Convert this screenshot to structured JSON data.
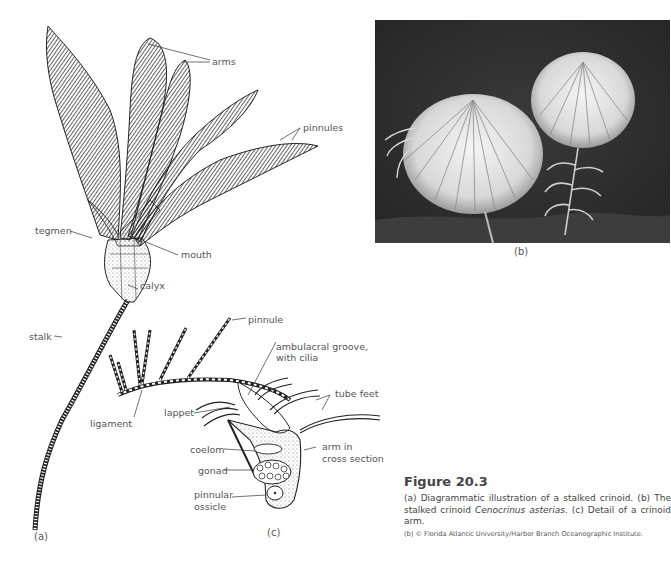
{
  "panel_a": {
    "label": "(a)",
    "callouts": {
      "arms": "arms",
      "pinnules": "pinnules",
      "tegmen": "tegmen",
      "mouth": "mouth",
      "calyx": "calyx",
      "stalk": "stalk"
    }
  },
  "panel_b": {
    "label": "(b)"
  },
  "panel_c": {
    "label": "(c)",
    "callouts": {
      "pinnule": "pinnule",
      "ambulacral_line1": "ambulacral groove,",
      "ambulacral_line2": "with cilia",
      "tube_feet": "tube feet",
      "lappet": "lappet",
      "ligament": "ligament",
      "coelom": "coelom",
      "arm_line1": "arm in",
      "arm_line2": "cross section",
      "gonad": "gonad",
      "ossicle_line1": "pinnular",
      "ossicle_line2": "ossicle"
    }
  },
  "caption": {
    "title": "Figure 20.3",
    "text_part1": "(a) Diagrammatic illustration of a stalked crinoid. (b) The stalked crinoid ",
    "species": "Cenocrinus asterias",
    "text_part2": ". (c) Detail of a crinoid arm.",
    "credit": "(b) © Florida Atlantic University/Harbor Branch Oceanographic Institute."
  }
}
